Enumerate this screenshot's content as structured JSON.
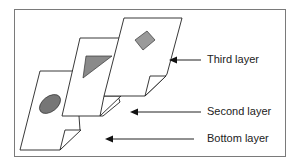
{
  "diagram": {
    "layers": [
      {
        "id": "bottom",
        "label": "Bottom layer",
        "shape": "ellipse",
        "shape_fill": "#767676"
      },
      {
        "id": "second",
        "label": "Second layer",
        "shape": "triangle",
        "shape_fill": "#8a8a8a"
      },
      {
        "id": "third",
        "label": "Third layer",
        "shape": "rectangle",
        "shape_fill": "#9a9a9a"
      }
    ],
    "colors": {
      "stroke": "#222222",
      "frame": "#7a7a7a",
      "page_fill": "#ffffff"
    }
  }
}
